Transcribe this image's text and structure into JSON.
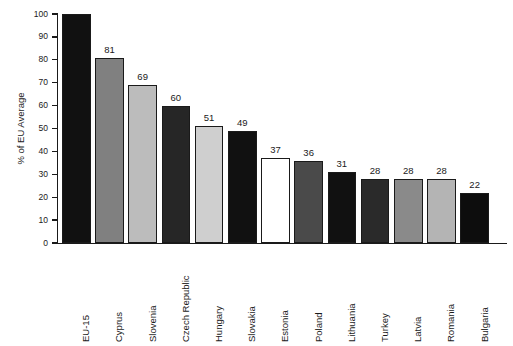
{
  "chart_data": {
    "type": "bar",
    "title": "",
    "subtitle": "",
    "xlabel": "",
    "ylabel": "% of EU Average",
    "ylim": [
      0,
      100
    ],
    "yticks": [
      0,
      10,
      20,
      30,
      40,
      50,
      60,
      70,
      80,
      90,
      100
    ],
    "grid": false,
    "legend": "none",
    "value_labels_shown": true,
    "first_bar_label_hidden": true,
    "categories": [
      "EU-15",
      "Cyprus",
      "Slovenia",
      "Czech Republic",
      "Hungary",
      "Slovakia",
      "Estonia",
      "Poland",
      "Lithuania",
      "Turkey",
      "Latvia",
      "Romania",
      "Bulgaria"
    ],
    "values": [
      100,
      81,
      69,
      60,
      51,
      49,
      37,
      36,
      31,
      28,
      28,
      28,
      22
    ],
    "value_labels": [
      "",
      "81",
      "69",
      "60",
      "51",
      "49",
      "37",
      "36",
      "31",
      "28",
      "28",
      "28",
      "22"
    ],
    "bar_colors": [
      "#111111",
      "#808080",
      "#bcbcbc",
      "#262626",
      "#cfcfcf",
      "#111111",
      "#ffffff",
      "#4a4a4a",
      "#111111",
      "#2a2a2a",
      "#8a8a8a",
      "#b4b4b4",
      "#0d0d0d"
    ],
    "bar_outline_color": "#1a1a1a",
    "axis_color": "#1a1a1a",
    "background_color": "#ffffff"
  }
}
